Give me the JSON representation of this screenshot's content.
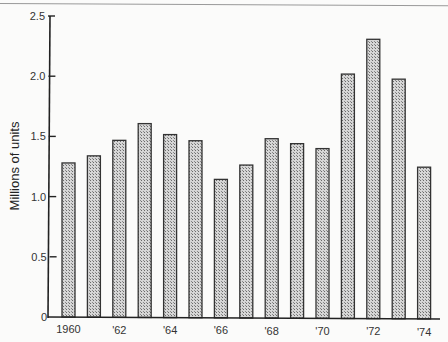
{
  "chart_data": {
    "type": "bar",
    "title": "",
    "xlabel": "",
    "ylabel": "Millions of units",
    "ylim": [
      0,
      2.5
    ],
    "yticks": [
      "0",
      "0.5",
      "1.0",
      "1.5",
      "2.0",
      "2.5"
    ],
    "categories": [
      "1960",
      "1961",
      "1962",
      "1963",
      "1964",
      "1965",
      "1966",
      "1967",
      "1968",
      "1969",
      "1970",
      "1971",
      "1972",
      "1973",
      "1974"
    ],
    "x_tick_labels": [
      {
        "index": 0,
        "label": "1960"
      },
      {
        "index": 2,
        "label": "'62"
      },
      {
        "index": 4,
        "label": "'64"
      },
      {
        "index": 6,
        "label": "'66"
      },
      {
        "index": 8,
        "label": "'68"
      },
      {
        "index": 10,
        "label": "'70"
      },
      {
        "index": 12,
        "label": "'72"
      },
      {
        "index": 14,
        "label": "'74"
      }
    ],
    "values": [
      1.28,
      1.34,
      1.47,
      1.61,
      1.52,
      1.47,
      1.15,
      1.27,
      1.49,
      1.45,
      1.41,
      2.03,
      2.32,
      1.99,
      1.26
    ],
    "grid": false,
    "legend": null,
    "bar_fill": "stippled gray",
    "bar_color": "#b8b8b8"
  }
}
